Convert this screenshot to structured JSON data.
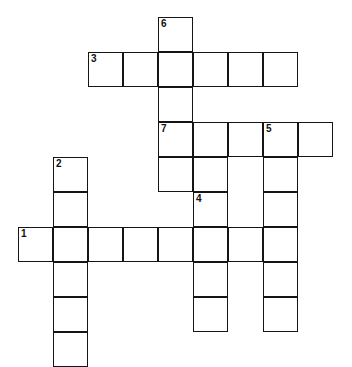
{
  "puzzle": {
    "title": "Crossword Puzzle Grid",
    "type": "blank-crossword-grid",
    "grid": {
      "columns": 10,
      "rows": 10,
      "cell_size_px": 35,
      "origin_x_px": 18,
      "origin_y_px": 17,
      "border_color": "#151515",
      "cell_fill": "#ffffff",
      "background": "#ffffff"
    },
    "cells": [
      {
        "col": 4,
        "row": 0
      },
      {
        "col": 2,
        "row": 1
      },
      {
        "col": 3,
        "row": 1
      },
      {
        "col": 4,
        "row": 1
      },
      {
        "col": 5,
        "row": 1
      },
      {
        "col": 6,
        "row": 1
      },
      {
        "col": 7,
        "row": 1
      },
      {
        "col": 4,
        "row": 2
      },
      {
        "col": 4,
        "row": 3
      },
      {
        "col": 5,
        "row": 3
      },
      {
        "col": 6,
        "row": 3
      },
      {
        "col": 7,
        "row": 3
      },
      {
        "col": 8,
        "row": 3
      },
      {
        "col": 4,
        "row": 4
      },
      {
        "col": 5,
        "row": 4
      },
      {
        "col": 7,
        "row": 4
      },
      {
        "col": 1,
        "row": 4
      },
      {
        "col": 1,
        "row": 5
      },
      {
        "col": 5,
        "row": 5
      },
      {
        "col": 7,
        "row": 5
      },
      {
        "col": 0,
        "row": 6
      },
      {
        "col": 1,
        "row": 6
      },
      {
        "col": 2,
        "row": 6
      },
      {
        "col": 3,
        "row": 6
      },
      {
        "col": 4,
        "row": 6
      },
      {
        "col": 5,
        "row": 6
      },
      {
        "col": 6,
        "row": 6
      },
      {
        "col": 7,
        "row": 6
      },
      {
        "col": 1,
        "row": 7
      },
      {
        "col": 5,
        "row": 7
      },
      {
        "col": 7,
        "row": 7
      },
      {
        "col": 1,
        "row": 8
      },
      {
        "col": 5,
        "row": 8
      },
      {
        "col": 7,
        "row": 8
      },
      {
        "col": 1,
        "row": 9
      }
    ],
    "clue_numbers": [
      {
        "label": "6",
        "col": 4,
        "row": 0
      },
      {
        "label": "3",
        "col": 2,
        "row": 1
      },
      {
        "label": "7",
        "col": 4,
        "row": 3
      },
      {
        "label": "5",
        "col": 7,
        "row": 3
      },
      {
        "label": "2",
        "col": 1,
        "row": 4
      },
      {
        "label": "4",
        "col": 5,
        "row": 5
      },
      {
        "label": "1",
        "col": 0,
        "row": 6
      }
    ],
    "entries": [
      {
        "number": "6",
        "direction": "down",
        "start_col": 4,
        "start_row": 0,
        "length": 5
      },
      {
        "number": "3",
        "direction": "across",
        "start_col": 2,
        "start_row": 1,
        "length": 6
      },
      {
        "number": "7",
        "direction": "across",
        "start_col": 4,
        "start_row": 3,
        "length": 5
      },
      {
        "number": "5",
        "direction": "down",
        "start_col": 7,
        "start_row": 3,
        "length": 6
      },
      {
        "number": "2",
        "direction": "down",
        "start_col": 1,
        "start_row": 4,
        "length": 6
      },
      {
        "number": "4",
        "direction": "down",
        "start_col": 5,
        "start_row": 5,
        "length": 4
      },
      {
        "number": "1",
        "direction": "across",
        "start_col": 0,
        "start_row": 6,
        "length": 8
      }
    ],
    "letters": []
  }
}
